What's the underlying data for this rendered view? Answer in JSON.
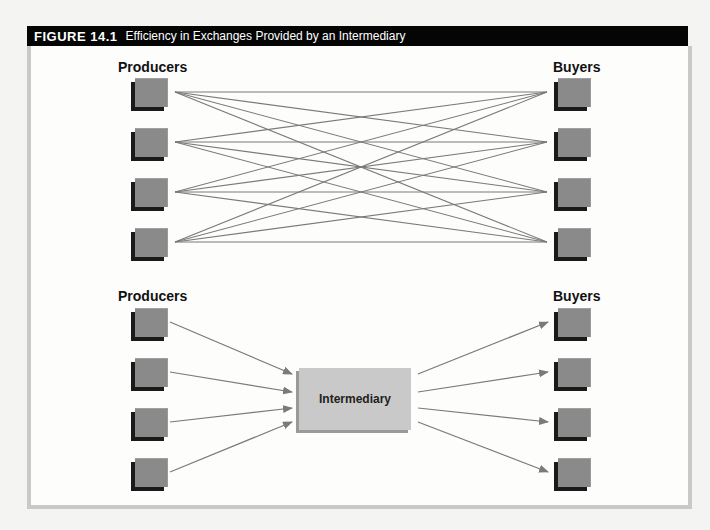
{
  "figure": {
    "number": "FIGURE 14.1",
    "title": "Efficiency in Exchanges Provided by an Intermediary"
  },
  "top_panel": {
    "producers_label": "Producers",
    "buyers_label": "Buyers",
    "producers_count": 4,
    "buyers_count": 4,
    "connections": "every producer connected to every buyer (16 lines)"
  },
  "bottom_panel": {
    "producers_label": "Producers",
    "buyers_label": "Buyers",
    "intermediary_label": "Intermediary",
    "producers_count": 4,
    "buyers_count": 4,
    "connections": "producers → intermediary → buyers (8 arrows)"
  },
  "colors": {
    "header_bg": "#050505",
    "node_fill": "#8a8a8a",
    "node_shadow": "#1a1a1a",
    "intermediary_fill": "#c9c9c9",
    "line": "#7a7a7a",
    "frame_border": "#c9c9c9"
  }
}
